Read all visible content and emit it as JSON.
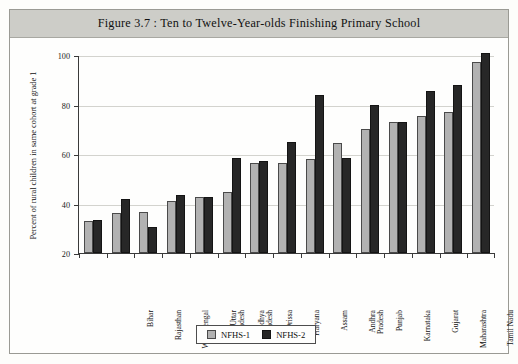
{
  "figure": {
    "title": "Figure 3.7 : Ten to Twelve-Year-olds Finishing Primary School"
  },
  "legend": {
    "position": "bottom-center",
    "items": [
      {
        "label": "NFHS-1",
        "color": "#b2b2b2"
      },
      {
        "label": "NFHS-2",
        "color": "#272727"
      }
    ]
  },
  "chart_data": {
    "type": "bar",
    "title": "Figure 3.7 : Ten to Twelve-Year-olds Finishing Primary School",
    "xlabel": "",
    "ylabel": "Percent of rural children in same cohort at grade 1",
    "ylim": [
      20,
      100
    ],
    "yticks": [
      20,
      40,
      60,
      80,
      100
    ],
    "grid": true,
    "orientation": "vertical",
    "grouped": true,
    "categories": [
      "Bihar",
      "Rajasthan",
      "West Bengal",
      "Uttar\nPradesh",
      "Madhya\nPradesh",
      "Orissa",
      "Haryana",
      "Assam",
      "Andhra\nPradesh",
      "Punjab",
      "Karnataka",
      "Gujarat",
      "Maharashtra",
      "Tamil Nadu",
      "Kerala"
    ],
    "series": [
      {
        "name": "NFHS-1",
        "color": "#b2b2b2",
        "values": [
          33,
          36,
          36.5,
          41,
          42.5,
          44.5,
          56.5,
          56.5,
          58,
          64.5,
          70,
          73,
          75.5,
          77,
          97
        ]
      },
      {
        "name": "NFHS-2",
        "color": "#272727",
        "values": [
          33.5,
          42,
          30.5,
          43.5,
          42.5,
          58.5,
          57,
          65,
          84,
          58.5,
          80,
          73,
          85.5,
          88,
          101
        ]
      }
    ]
  }
}
